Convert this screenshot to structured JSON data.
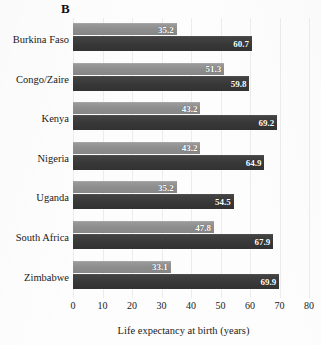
{
  "panel": {
    "letter": "B"
  },
  "chart_data": {
    "type": "bar",
    "orientation": "horizontal",
    "title": "B",
    "xlabel": "Life expectancy at birth (years)",
    "ylabel": "",
    "xlim": [
      0,
      80
    ],
    "xticks": [
      0,
      10,
      20,
      30,
      40,
      50,
      60,
      70,
      80
    ],
    "grid": true,
    "grid_axis": "x",
    "legend": null,
    "legend_position": "none",
    "categories": [
      "Burkina Faso",
      "Congo/Zaire",
      "Kenya",
      "Nigeria",
      "Uganda",
      "South Africa",
      "Zimbabwe"
    ],
    "series": [
      {
        "name": "light",
        "color": "#8e8e8e",
        "values": [
          35.2,
          51.3,
          43.2,
          43.2,
          35.2,
          47.8,
          33.1
        ]
      },
      {
        "name": "dark",
        "color": "#383838",
        "values": [
          60.7,
          59.8,
          69.2,
          64.9,
          54.5,
          67.9,
          69.9
        ]
      }
    ],
    "value_labels": [
      [
        "35.2",
        "60.7"
      ],
      [
        "51.3",
        "59.8"
      ],
      [
        "43.2",
        "69.2"
      ],
      [
        "43.2",
        "64.9"
      ],
      [
        "35.2",
        "54.5"
      ],
      [
        "47.8",
        "67.9"
      ],
      [
        "33.1",
        "69.9"
      ]
    ]
  },
  "axis": {
    "tick_labels": [
      "0",
      "10",
      "20",
      "30",
      "40",
      "50",
      "60",
      "70",
      "80"
    ],
    "title": "Life expectancy at birth (years)"
  }
}
